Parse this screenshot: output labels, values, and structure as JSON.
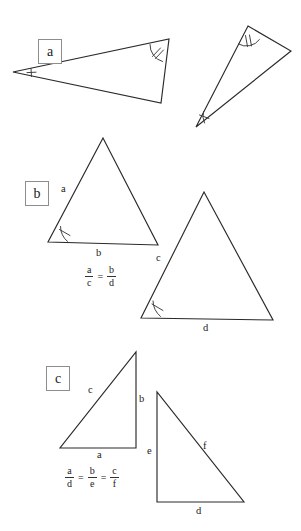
{
  "figure": {
    "background_color": "#ffffff",
    "stroke_color": "#2a2a2a"
  },
  "sections": [
    {
      "key": "a",
      "label": "a",
      "description": "Two similar scalene triangles with matching angle tick marks"
    },
    {
      "key": "b",
      "label": "b",
      "description": "Two similar isosceles triangles with a single angle tick mark each"
    },
    {
      "key": "c",
      "label": "c",
      "description": "Two similar right triangles"
    }
  ],
  "labels": {
    "b_triangle1_side_a": "a",
    "b_triangle1_side_b": "b",
    "b_triangle2_side_c": "c",
    "b_triangle2_side_d": "d",
    "c_triangle1_side_c": "c",
    "c_triangle1_side_b": "b",
    "c_triangle1_side_a": "a",
    "c_triangle2_side_e": "e",
    "c_triangle2_side_f": "f",
    "c_triangle2_side_d": "d"
  },
  "equations": {
    "b": {
      "terms": [
        {
          "numerator": "a",
          "denominator": "c"
        },
        {
          "numerator": "b",
          "denominator": "d"
        }
      ],
      "operator": "=",
      "text": "a/c = b/d"
    },
    "c": {
      "terms": [
        {
          "numerator": "a",
          "denominator": "d"
        },
        {
          "numerator": "b",
          "denominator": "e"
        },
        {
          "numerator": "c",
          "denominator": "f"
        }
      ],
      "operator": "=",
      "text": "a/d = b/e = c/f"
    }
  }
}
